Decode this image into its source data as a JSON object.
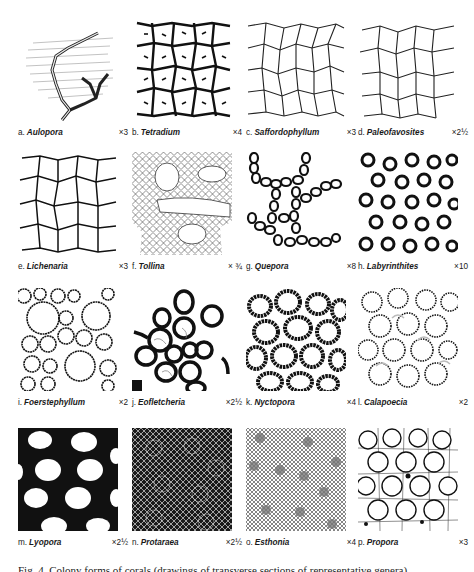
{
  "figure": {
    "panels": [
      {
        "letter": "a.",
        "genus": "Aulopora",
        "magnification": "×3",
        "style": "branching"
      },
      {
        "letter": "b.",
        "genus": "Tetradium",
        "magnification": "×4",
        "style": "spiny-grid"
      },
      {
        "letter": "c.",
        "genus": "Saffordophyllum",
        "magnification": "×3",
        "style": "polygonal-thin"
      },
      {
        "letter": "d.",
        "genus": "Paleofavosites",
        "magnification": "×2½",
        "style": "polygonal-thin"
      },
      {
        "letter": "e.",
        "genus": "Lichenaria",
        "magnification": "×3",
        "style": "polygonal"
      },
      {
        "letter": "f.",
        "genus": "Tollina",
        "magnification": "× ¾",
        "style": "fine-mesh-holes"
      },
      {
        "letter": "g.",
        "genus": "Quepora",
        "magnification": "×8",
        "style": "chains"
      },
      {
        "letter": "h.",
        "genus": "Labyrinthites",
        "magnification": "×10",
        "style": "thick-rings"
      },
      {
        "letter": "i.",
        "genus": "Foerstephyllum",
        "magnification": "×2",
        "style": "spiny-polygonal"
      },
      {
        "letter": "j.",
        "genus": "Eofletcheria",
        "magnification": "×2½",
        "style": "thick-circles"
      },
      {
        "letter": "k.",
        "genus": "Nyctopora",
        "magnification": "×4",
        "style": "heavy-spiny"
      },
      {
        "letter": "l.",
        "genus": "Calapoecia",
        "magnification": "×2",
        "style": "dotted-polygonal"
      },
      {
        "letter": "m.",
        "genus": "Lyopora",
        "magnification": "×2½",
        "style": "black-holes"
      },
      {
        "letter": "n.",
        "genus": "Protaraea",
        "magnification": "×2½",
        "style": "dark-mesh"
      },
      {
        "letter": "o.",
        "genus": "Esthonia",
        "magnification": "×4",
        "style": "stippled"
      },
      {
        "letter": "p.",
        "genus": "Propora",
        "magnification": "×3",
        "style": "circles-mesh"
      }
    ],
    "caption": "Fig. 4. Colony forms of corals (drawings of transverse sections of representative genera)."
  }
}
